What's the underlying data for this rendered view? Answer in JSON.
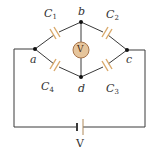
{
  "diagram": {
    "type": "capacitor bridge circuit",
    "colors": {
      "wire": "#3a3a3a",
      "capacitor_plate": "#d9a96a",
      "voltmeter_fill": "#e6c59c",
      "voltmeter_stroke": "#a8744a",
      "node": "#111111"
    },
    "nodes": {
      "a": "a",
      "b": "b",
      "c": "c",
      "d": "d"
    },
    "capacitors": {
      "c1": {
        "base": "C",
        "sub": "1"
      },
      "c2": {
        "base": "C",
        "sub": "2"
      },
      "c3": {
        "base": "C",
        "sub": "3"
      },
      "c4": {
        "base": "C",
        "sub": "4"
      }
    },
    "voltmeter": {
      "symbol": "V"
    },
    "battery": {
      "label": "V"
    }
  }
}
